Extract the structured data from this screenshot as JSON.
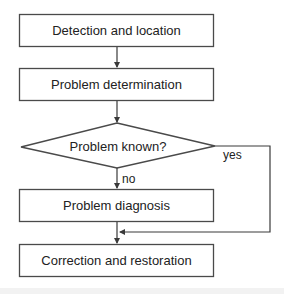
{
  "diagram": {
    "type": "flowchart",
    "nodes": [
      {
        "id": "detect",
        "shape": "rect",
        "label": "Detection and location"
      },
      {
        "id": "determine",
        "shape": "rect",
        "label": "Problem determination"
      },
      {
        "id": "known",
        "shape": "diamond",
        "label": "Problem known?"
      },
      {
        "id": "diagnose",
        "shape": "rect",
        "label": "Problem diagnosis"
      },
      {
        "id": "correct",
        "shape": "rect",
        "label": "Correction and restoration"
      }
    ],
    "edges": [
      {
        "from": "detect",
        "to": "determine",
        "label": ""
      },
      {
        "from": "determine",
        "to": "known",
        "label": ""
      },
      {
        "from": "known",
        "to": "diagnose",
        "label": "no"
      },
      {
        "from": "known",
        "to": "correct",
        "label": "yes"
      },
      {
        "from": "diagnose",
        "to": "correct",
        "label": ""
      }
    ],
    "labels": {
      "yes": "yes",
      "no": "no"
    },
    "colors": {
      "stroke": "#4a4a4a",
      "text": "#222222",
      "background": "#ffffff"
    }
  }
}
